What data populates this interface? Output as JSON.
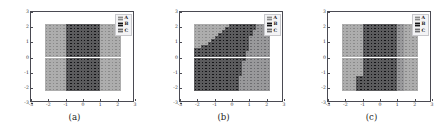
{
  "figure": {
    "panel_count": 3,
    "classes": [
      "A",
      "B",
      "C"
    ],
    "class_colors": {
      "A": "#8a8a8a",
      "B": "#151518",
      "C": "#6d6d70"
    },
    "axes": {
      "xlim": [
        -3,
        3
      ],
      "ylim": [
        -3,
        3
      ],
      "xticks": [
        "-3",
        "-2",
        "-1",
        "0",
        "1",
        "2",
        "3"
      ],
      "yticks": [
        "3",
        "2",
        "1",
        "0",
        "-1",
        "-2",
        "-3"
      ],
      "xtick_values": [
        -3,
        -2,
        -1,
        0,
        1,
        2,
        3
      ],
      "ytick_values": [
        3,
        2,
        1,
        0,
        -1,
        -2,
        -3
      ],
      "grid": false,
      "xlabel": "",
      "ylabel": ""
    },
    "panels": [
      {
        "caption": "(a)",
        "legend_labels": [
          "A",
          "B",
          "C"
        ]
      },
      {
        "caption": "(b)",
        "legend_labels": [
          "A",
          "B",
          "C"
        ]
      },
      {
        "caption": "(c)",
        "legend_labels": [
          "A",
          "B",
          "C"
        ]
      }
    ]
  },
  "chart_data": {
    "type": "heatmap",
    "title": "",
    "xlabel": "",
    "ylabel": "",
    "xlim": [
      -3,
      3
    ],
    "ylim": [
      -3,
      3
    ],
    "xticks": [
      -3,
      -2,
      -1,
      0,
      1,
      2,
      3
    ],
    "yticks": [
      -3,
      -2,
      -1,
      0,
      1,
      2,
      3
    ],
    "grid": false,
    "legend_position": "upper right",
    "legend_entries": [
      "A",
      "B",
      "C"
    ],
    "class_colors": {
      "A": "#8a8a8a",
      "B": "#151518",
      "C": "#6d6d70"
    },
    "marker": "square",
    "data_extent": {
      "x": [
        -2.2,
        2.2
      ],
      "y": [
        -2.2,
        2.2
      ]
    },
    "grid_resolution": {
      "nx": 22,
      "ny": 22
    },
    "cell_size": 0.2,
    "panels": [
      {
        "caption": "(a)",
        "description": "Vertical band decision regions: class A on the left and right flanks, class B occupying the central vertical band from x=-1 to x=1 across the full y range.",
        "regions": [
          {
            "class": "A",
            "x": [
              -2.2,
              -1.0
            ],
            "y": [
              -2.2,
              2.2
            ]
          },
          {
            "class": "B",
            "x": [
              -1.0,
              1.0
            ],
            "y": [
              -2.2,
              2.2
            ]
          },
          {
            "class": "A",
            "x": [
              1.0,
              2.2
            ],
            "y": [
              -2.2,
              2.2
            ]
          }
        ],
        "column_class_by_x": [
          {
            "x": -2.1,
            "class": "A",
            "y_top": 2.2
          },
          {
            "x": -1.9,
            "class": "A",
            "y_top": 2.2
          },
          {
            "x": -1.7,
            "class": "A",
            "y_top": 2.2
          },
          {
            "x": -1.5,
            "class": "A",
            "y_top": 2.2
          },
          {
            "x": -1.3,
            "class": "A",
            "y_top": 2.2
          },
          {
            "x": -1.1,
            "class": "A",
            "y_top": 2.2
          },
          {
            "x": -0.9,
            "class": "B",
            "y_top": 2.2
          },
          {
            "x": -0.7,
            "class": "B",
            "y_top": 2.2
          },
          {
            "x": -0.5,
            "class": "B",
            "y_top": 2.2
          },
          {
            "x": -0.3,
            "class": "B",
            "y_top": 2.2
          },
          {
            "x": -0.1,
            "class": "B",
            "y_top": 2.2
          },
          {
            "x": 0.1,
            "class": "B",
            "y_top": 2.2
          },
          {
            "x": 0.3,
            "class": "B",
            "y_top": 2.2
          },
          {
            "x": 0.5,
            "class": "B",
            "y_top": 2.2
          },
          {
            "x": 0.7,
            "class": "B",
            "y_top": 2.2
          },
          {
            "x": 0.9,
            "class": "B",
            "y_top": 2.2
          },
          {
            "x": 1.1,
            "class": "A",
            "y_top": 2.2
          },
          {
            "x": 1.3,
            "class": "A",
            "y_top": 2.2
          },
          {
            "x": 1.5,
            "class": "A",
            "y_top": 2.2
          },
          {
            "x": 1.7,
            "class": "A",
            "y_top": 2.2
          },
          {
            "x": 1.9,
            "class": "A",
            "y_top": 2.2
          },
          {
            "x": 2.1,
            "class": "A",
            "y_top": 2.2
          }
        ]
      },
      {
        "caption": "(b)",
        "description": "Diagonal staircase boundary: class B forms vertical bars whose tops rise from y=0.4 at x=-2.2 up to y=2.2 near x=0, filling the lower-left to upper-middle wedge; class A fills above the staircase, class C occupies the lower-right block beyond x=0.6.",
        "bars": [
          {
            "x": -2.1,
            "class": "B",
            "y_bottom": -2.2,
            "y_top": 0.4
          },
          {
            "x": -1.9,
            "class": "B",
            "y_bottom": -2.2,
            "y_top": 0.4
          },
          {
            "x": -1.7,
            "class": "B",
            "y_bottom": -2.2,
            "y_top": 0.6
          },
          {
            "x": -1.5,
            "class": "B",
            "y_bottom": -2.2,
            "y_top": 0.6
          },
          {
            "x": -1.3,
            "class": "B",
            "y_bottom": -2.2,
            "y_top": 0.8
          },
          {
            "x": -1.1,
            "class": "B",
            "y_bottom": -2.2,
            "y_top": 1.0
          },
          {
            "x": -0.9,
            "class": "B",
            "y_bottom": -2.2,
            "y_top": 1.2
          },
          {
            "x": -0.7,
            "class": "B",
            "y_bottom": -2.2,
            "y_top": 1.4
          },
          {
            "x": -0.5,
            "class": "B",
            "y_bottom": -2.2,
            "y_top": 1.6
          },
          {
            "x": -0.3,
            "class": "B",
            "y_bottom": -2.2,
            "y_top": 1.8
          },
          {
            "x": -0.1,
            "class": "B",
            "y_bottom": -2.2,
            "y_top": 2.2
          },
          {
            "x": 0.1,
            "class": "B",
            "y_bottom": -2.2,
            "y_top": 2.2
          },
          {
            "x": 0.3,
            "class": "B",
            "y_bottom": -2.2,
            "y_top": 2.2
          },
          {
            "x": 0.5,
            "class": "B",
            "y_bottom": -1.0,
            "y_top": 2.2
          },
          {
            "x": 0.7,
            "class": "B",
            "y_bottom": 0.0,
            "y_top": 2.2
          },
          {
            "x": 0.9,
            "class": "B",
            "y_bottom": 0.6,
            "y_top": 2.2
          },
          {
            "x": 1.1,
            "class": "B",
            "y_bottom": 1.6,
            "y_top": 2.2
          },
          {
            "x": 1.3,
            "class": "B",
            "y_bottom": 2.0,
            "y_top": 2.2
          }
        ],
        "regions": [
          {
            "class": "A",
            "note": "background above staircase, x from -2.2 to 2.2"
          },
          {
            "class": "C",
            "note": "lower-right block, x from 0.5 to 2.2, y below staircase"
          }
        ]
      },
      {
        "caption": "(c)",
        "description": "Alternating vertical stripes: class B appears as thin full-height stripes within the central band x=-1.1 to x=0.9, separated by class A; a single short class B stripe sits at x=-1.2 near y=-1.4 to -2.2; class C shades the right flank near x=1.0 to 1.2.",
        "stripes": [
          {
            "x": -1.2,
            "class": "B",
            "y_bottom": -2.2,
            "y_top": -1.3
          },
          {
            "x": -1.0,
            "class": "B",
            "y_bottom": -2.2,
            "y_top": 2.2
          },
          {
            "x": -0.8,
            "class": "B",
            "y_bottom": -2.2,
            "y_top": 2.2
          },
          {
            "x": -0.6,
            "class": "B",
            "y_bottom": -2.2,
            "y_top": 2.2
          },
          {
            "x": -0.4,
            "class": "B",
            "y_bottom": -2.2,
            "y_top": 2.2
          },
          {
            "x": -0.2,
            "class": "B",
            "y_bottom": -2.2,
            "y_top": 2.2
          },
          {
            "x": 0.0,
            "class": "B",
            "y_bottom": -2.2,
            "y_top": 2.2
          },
          {
            "x": 0.2,
            "class": "B",
            "y_bottom": -2.2,
            "y_top": 2.2
          },
          {
            "x": 0.4,
            "class": "B",
            "y_bottom": -2.2,
            "y_top": 2.2
          },
          {
            "x": 0.6,
            "class": "B",
            "y_bottom": -2.2,
            "y_top": 2.2
          },
          {
            "x": 0.8,
            "class": "B",
            "y_bottom": -2.2,
            "y_top": 2.2
          }
        ],
        "regions": [
          {
            "class": "A",
            "x": [
              -2.2,
              -1.1
            ],
            "y": [
              -2.2,
              2.2
            ]
          },
          {
            "class": "A",
            "x": [
              0.9,
              2.2
            ],
            "y": [
              -2.2,
              2.2
            ]
          },
          {
            "class": "C",
            "x": [
              0.9,
              1.3
            ],
            "y": [
              -2.2,
              2.2
            ]
          }
        ]
      }
    ]
  }
}
